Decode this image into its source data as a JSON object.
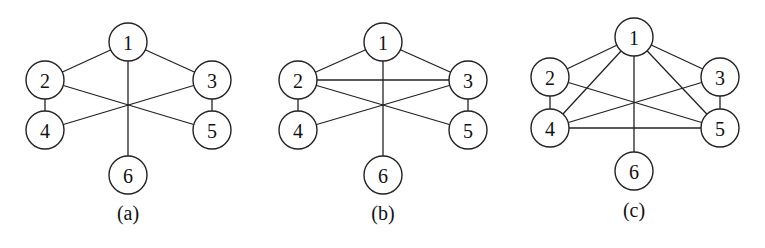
{
  "node_radius": 19,
  "graphs": [
    {
      "id": "a",
      "caption": "(a)",
      "offset_x": 0,
      "nodes": [
        {
          "id": "1",
          "label": "1",
          "x": 128,
          "y": 42
        },
        {
          "id": "2",
          "label": "2",
          "x": 45,
          "y": 80
        },
        {
          "id": "3",
          "label": "3",
          "x": 212,
          "y": 80
        },
        {
          "id": "4",
          "label": "4",
          "x": 45,
          "y": 130
        },
        {
          "id": "5",
          "label": "5",
          "x": 212,
          "y": 130
        },
        {
          "id": "6",
          "label": "6",
          "x": 128,
          "y": 175
        }
      ],
      "edges": [
        [
          "1",
          "2"
        ],
        [
          "1",
          "3"
        ],
        [
          "1",
          "6"
        ],
        [
          "2",
          "4"
        ],
        [
          "3",
          "5"
        ],
        [
          "2",
          "5"
        ],
        [
          "3",
          "4"
        ]
      ],
      "caption_pos": {
        "x": 128,
        "y": 213
      }
    },
    {
      "id": "b",
      "caption": "(b)",
      "offset_x": 255,
      "nodes": [
        {
          "id": "1",
          "label": "1",
          "x": 128,
          "y": 42
        },
        {
          "id": "2",
          "label": "2",
          "x": 43,
          "y": 80
        },
        {
          "id": "3",
          "label": "3",
          "x": 213,
          "y": 80
        },
        {
          "id": "4",
          "label": "4",
          "x": 43,
          "y": 130
        },
        {
          "id": "5",
          "label": "5",
          "x": 213,
          "y": 130
        },
        {
          "id": "6",
          "label": "6",
          "x": 128,
          "y": 175
        }
      ],
      "edges": [
        [
          "1",
          "2"
        ],
        [
          "1",
          "3"
        ],
        [
          "1",
          "6"
        ],
        [
          "2",
          "3"
        ],
        [
          "2",
          "4"
        ],
        [
          "3",
          "5"
        ],
        [
          "2",
          "5"
        ],
        [
          "3",
          "4"
        ]
      ],
      "caption_pos": {
        "x": 128,
        "y": 213
      }
    },
    {
      "id": "c",
      "caption": "(c)",
      "offset_x": 510,
      "nodes": [
        {
          "id": "1",
          "label": "1",
          "x": 124,
          "y": 37
        },
        {
          "id": "2",
          "label": "2",
          "x": 40,
          "y": 77
        },
        {
          "id": "3",
          "label": "3",
          "x": 210,
          "y": 77
        },
        {
          "id": "4",
          "label": "4",
          "x": 40,
          "y": 128
        },
        {
          "id": "5",
          "label": "5",
          "x": 210,
          "y": 128
        },
        {
          "id": "6",
          "label": "6",
          "x": 124,
          "y": 171
        }
      ],
      "edges": [
        [
          "1",
          "2"
        ],
        [
          "1",
          "3"
        ],
        [
          "1",
          "4"
        ],
        [
          "1",
          "5"
        ],
        [
          "1",
          "6"
        ],
        [
          "2",
          "4"
        ],
        [
          "3",
          "5"
        ],
        [
          "2",
          "5"
        ],
        [
          "3",
          "4"
        ],
        [
          "4",
          "5"
        ]
      ],
      "caption_pos": {
        "x": 124,
        "y": 210
      }
    }
  ]
}
